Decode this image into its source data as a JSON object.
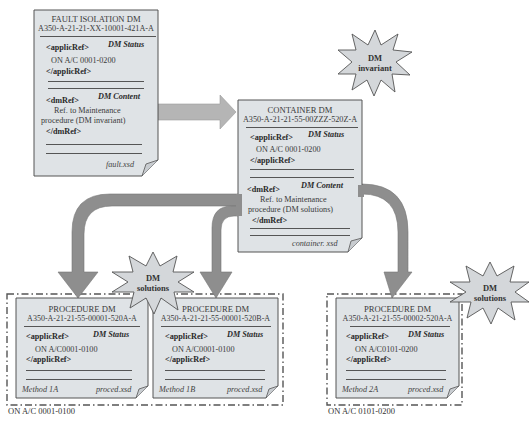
{
  "colors": {
    "doc_fill": "#dfe3e6",
    "doc_border": "#555555",
    "arrow_fill": "#8e8e8e",
    "arrow_fill_light": "#b5b5b5",
    "burst_fill": "#d4d7da"
  },
  "fault_dm": {
    "title": "FAULT ISOLATION DM",
    "code": "A350-A-21-21-XX-10001-421A-A",
    "applic_open": "<applicRef>",
    "status_label": "DM Status",
    "applic_value": "ON A/C 0001-0200",
    "applic_close": "</applicRef>",
    "dmref_open": "<dmRef>",
    "content_label": "DM Content",
    "content_line1": "Ref. to Maintenance",
    "content_line2": "procedure (DM invariant)",
    "dmref_close": "</dmRef>",
    "schema": "fault.xsd"
  },
  "container_dm": {
    "title": "CONTAINER DM",
    "code": "A350-A-21-21-55-00ZZZ-520Z-A",
    "applic_open": "<applicRef>",
    "status_label": "DM Status",
    "applic_value": "ON A/C 0001-0200",
    "applic_close": "</applicRef>",
    "dmref_open": "<dmRef>",
    "content_label": "DM Content",
    "content_line1": "Ref. to Maintenance",
    "content_line2": "procedure (DM solutions)",
    "dmref_close": "</dmRef>",
    "schema": "container. xsd"
  },
  "bursts": {
    "invariant": {
      "line1": "DM",
      "line2": "invariant"
    },
    "solutions_1": {
      "line1": "DM",
      "line2": "solutions"
    },
    "solutions_2": {
      "line1": "DM",
      "line2": "solutions"
    }
  },
  "procedures": [
    {
      "title": "PROCEDURE DM",
      "code": "A350-A-21-21-55-00001-520A-A",
      "applic_open": "<applicRef>",
      "status_label": "DM Status",
      "applic_value": "ON A/C0001-0100",
      "applic_close": "</applicRef>",
      "method": "Method 1A",
      "schema": "proced.xsd"
    },
    {
      "title": "PROCEDURE DM",
      "code": "A350-A-21-21-55-00001-520B-A",
      "applic_open": "<applicRef>",
      "status_label": "DM Status",
      "applic_value": "ON A/C0001-0100",
      "applic_close": "</applicRef>",
      "method": "Method 1B",
      "schema": "proced.xsd"
    },
    {
      "title": "PROCEDURE DM",
      "code": "A350-A-21-21-55-00002-520A-A",
      "applic_open": "<applicRef>",
      "status_label": "DM Status",
      "applic_value": "ON A/C0101-0200",
      "applic_close": "</applicRef>",
      "method": "Method 2A",
      "schema": "proced.xsd"
    }
  ],
  "groups": {
    "group1_label": "ON A/C 0001-0100",
    "group2_label": "ON A/C 0101-0200"
  }
}
